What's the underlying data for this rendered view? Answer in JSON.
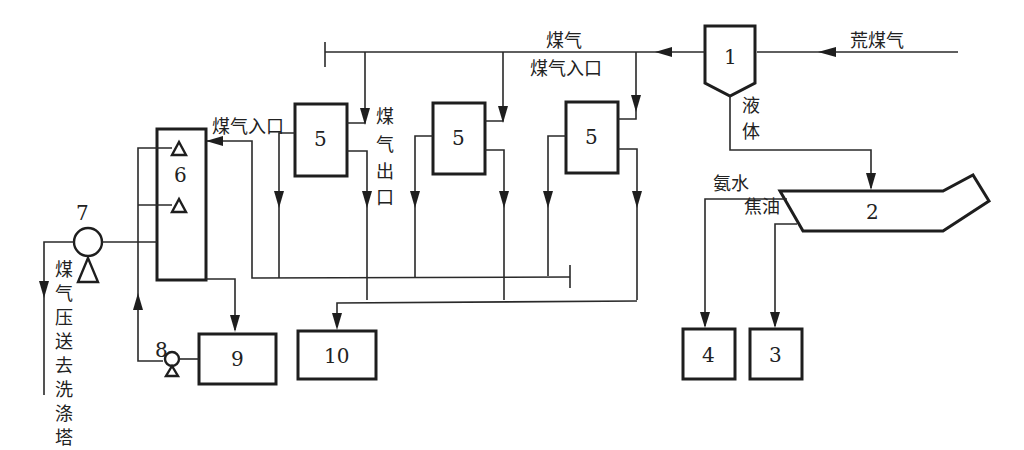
{
  "diagram": {
    "type": "process-flow",
    "units": {
      "u1": "1",
      "u2": "2",
      "u3": "3",
      "u4": "4",
      "u5a": "5",
      "u5b": "5",
      "u5c": "5",
      "u6": "6",
      "u7": "7",
      "u8": "8",
      "u9": "9",
      "u10": "10"
    },
    "labels": {
      "raw_gas": "荒煤气",
      "gas_top": "煤气",
      "gas_inlet_top": "煤气入口",
      "liquid_1": "液",
      "liquid_2": "体",
      "gas_inlet_left": "煤气入口",
      "gas_outlet_1": "煤",
      "gas_outlet_2": "气",
      "gas_outlet_3": "出",
      "gas_outlet_4": "口",
      "ammonia_water": "氨水",
      "tar": "焦油",
      "to_washer": [
        "煤",
        "气",
        "压",
        "送",
        "去",
        "洗",
        "涤",
        "塔"
      ]
    },
    "colors": {
      "line": "#2a2a2a",
      "background": "#ffffff"
    }
  }
}
